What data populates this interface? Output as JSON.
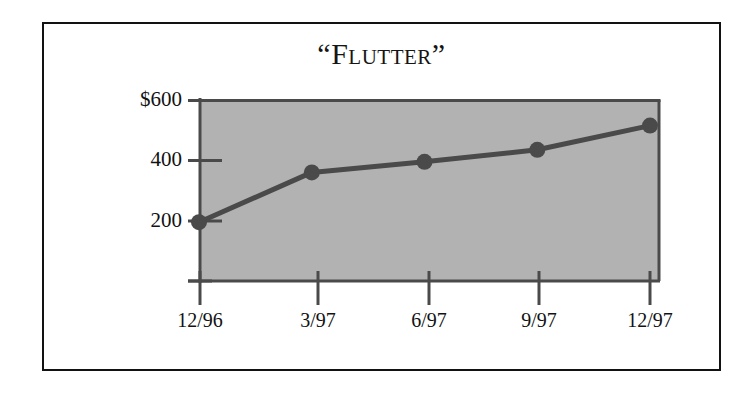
{
  "chart_data": {
    "type": "line",
    "title": "“Flutter”",
    "title_text": "Flutter",
    "open_quote": "“",
    "close_quote": "”",
    "categories": [
      "12/96",
      "3/97",
      "6/97",
      "9/97",
      "12/97"
    ],
    "values": [
      195,
      360,
      395,
      435,
      515
    ],
    "series": [
      {
        "name": "Flutter",
        "values": [
          195,
          360,
          395,
          435,
          515
        ]
      }
    ],
    "xlabel": "",
    "ylabel": "",
    "ylim": [
      0,
      600
    ],
    "ytick_values": [
      0,
      200,
      400,
      600
    ],
    "ytick_labels": [
      "",
      "200",
      "400",
      "$600"
    ],
    "xtick_labels": [
      "12/96",
      "3/97",
      "6/97",
      "9/97",
      "12/97"
    ],
    "grid": false,
    "legend": false,
    "legend_position": "none",
    "plot_background_color": "#b2b2b2",
    "line_color": "#4a4a4a",
    "marker_color": "#4a4a4a",
    "marker_shape": "circle",
    "axis_color": "#4a4a4a",
    "frame_color": "#121212",
    "page_background_color": "#ffffff"
  },
  "axes": {
    "y": {
      "ticks": [
        {
          "label": "$600",
          "value": 600
        },
        {
          "label": "400",
          "value": 400
        },
        {
          "label": "200",
          "value": 200
        },
        {
          "label": "",
          "value": 0
        }
      ]
    },
    "x": {
      "ticks": [
        {
          "label": "12/96"
        },
        {
          "label": "3/97"
        },
        {
          "label": "6/97"
        },
        {
          "label": "9/97"
        },
        {
          "label": "12/97"
        }
      ]
    }
  }
}
